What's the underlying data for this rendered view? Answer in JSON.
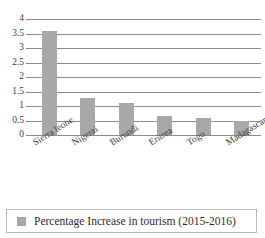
{
  "chart_data": {
    "type": "bar",
    "title": "",
    "xlabel": "",
    "ylabel": "",
    "ylim": [
      0,
      4
    ],
    "ytick_step": 0.5,
    "grid": true,
    "legend_position": "bottom",
    "bar_color": "#a8a8a8",
    "gridline_color": "#8d8d8d",
    "categories": [
      "Sierra leone",
      "Nigerai",
      "Burundi",
      "Eritrea",
      "Togo",
      "Madagascar"
    ],
    "values": [
      3.6,
      1.27,
      1.12,
      0.65,
      0.58,
      0.5
    ],
    "ticks": [
      "0",
      "0.5",
      "1",
      "1.5",
      "2",
      "2.5",
      "3",
      "3.5",
      "4"
    ],
    "tick_values": [
      0,
      0.5,
      1,
      1.5,
      2,
      2.5,
      3,
      3.5,
      4
    ],
    "series": [
      {
        "name": "Percentage Increase in tourism (2015-2016)",
        "values": [
          3.6,
          1.27,
          1.12,
          0.65,
          0.58,
          0.5
        ]
      }
    ]
  },
  "legend": {
    "label": "Percentage Increase in tourism (2015-2016)",
    "swatch_color": "#a8a8a8"
  }
}
